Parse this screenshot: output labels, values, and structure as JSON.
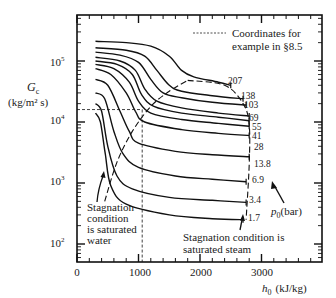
{
  "chart_data": {
    "type": "line",
    "title": "",
    "xlabel": "h0 (kJ/kg)",
    "ylabel": "Gc (kg/m² s)",
    "xscale": "linear",
    "yscale": "log",
    "xlim": [
      0,
      3900
    ],
    "ylim": [
      50,
      450000
    ],
    "x_ticks": [
      "0",
      "1000",
      "2000",
      "3000"
    ],
    "y_ticks": [
      "10^2",
      "10^3",
      "10^4",
      "10^5"
    ],
    "legend_title": "p0(bar)",
    "series": [
      {
        "name": "207",
        "x": [
          300,
          800,
          1200,
          1500,
          1700,
          1900,
          2300,
          2500
        ],
        "y": [
          210000,
          200000,
          175000,
          120000,
          70000,
          55000,
          45000,
          40000
        ]
      },
      {
        "name": "138",
        "x": [
          300,
          800,
          1100,
          1300,
          1500,
          1700,
          2200,
          2700
        ],
        "y": [
          165000,
          150000,
          120000,
          70000,
          40000,
          32000,
          27000,
          24000
        ]
      },
      {
        "name": "103",
        "x": [
          300,
          700,
          1000,
          1200,
          1400,
          1700,
          2200,
          2750
        ],
        "y": [
          140000,
          125000,
          95000,
          50000,
          30000,
          25000,
          21000,
          19000
        ]
      },
      {
        "name": "69",
        "x": [
          300,
          700,
          950,
          1100,
          1300,
          1700,
          2300,
          2800
        ],
        "y": [
          115000,
          100000,
          70000,
          35000,
          22000,
          17000,
          14000,
          12500
        ]
      },
      {
        "name": "55",
        "x": [
          300,
          650,
          900,
          1050,
          1250,
          1700,
          2300,
          2800
        ],
        "y": [
          100000,
          88000,
          60000,
          28000,
          18000,
          14000,
          12000,
          10500
        ]
      },
      {
        "name": "41",
        "x": [
          300,
          600,
          850,
          1000,
          1200,
          1700,
          2300,
          2800
        ],
        "y": [
          88000,
          75000,
          45000,
          22000,
          14000,
          11000,
          9500,
          8500
        ]
      },
      {
        "name": "28",
        "x": [
          300,
          550,
          800,
          950,
          1100,
          1700,
          2300,
          2800
        ],
        "y": [
          75000,
          60000,
          30000,
          15000,
          10000,
          7500,
          6500,
          6000
        ]
      },
      {
        "name": "13.8",
        "x": [
          300,
          500,
          700,
          850,
          1000,
          1600,
          2200,
          2800
        ],
        "y": [
          50000,
          40000,
          15000,
          7000,
          4500,
          3300,
          2900,
          2700
        ]
      },
      {
        "name": "6.9",
        "x": [
          300,
          450,
          600,
          750,
          1000,
          1600,
          2200,
          2750
        ],
        "y": [
          30000,
          24000,
          7000,
          3000,
          1800,
          1300,
          1150,
          1050
        ]
      },
      {
        "name": "3.4",
        "x": [
          300,
          400,
          500,
          650,
          900,
          1500,
          2200,
          2750
        ],
        "y": [
          20000,
          15000,
          4000,
          1300,
          800,
          580,
          520,
          480
        ]
      },
      {
        "name": "1.7",
        "x": [
          300,
          380,
          460,
          550,
          800,
          1500,
          2200,
          2700
        ],
        "y": [
          14000,
          10000,
          3000,
          900,
          450,
          300,
          260,
          250
        ]
      }
    ],
    "boundary_curves": [
      {
        "name": "saturated water (stagnation)",
        "style": "dashed",
        "x": [
          450,
          650,
          900,
          1200,
          1500,
          1800
        ],
        "y": [
          500,
          2200,
          7000,
          18000,
          32000,
          48000
        ]
      },
      {
        "name": "saturated steam (stagnation)",
        "style": "dashed",
        "x": [
          1800,
          2400,
          2700,
          2800,
          2800,
          2750
        ],
        "y": [
          48000,
          40000,
          20000,
          9000,
          2000,
          250
        ]
      }
    ],
    "example_coordinates": {
      "x": 1060,
      "y": 16000,
      "style": "dashed"
    },
    "annotations": [
      "Coordinates for example in §8.5",
      "Stagnation condition is saturated water",
      "Stagnation condition is saturated steam",
      "p0(bar)"
    ]
  },
  "labels": {
    "ylabel_main": "G",
    "ylabel_sub": "c",
    "ylabel_units": "(kg/m² s)",
    "xlabel_main": "h",
    "xlabel_sub": "0",
    "xlabel_units": "(kJ/kg)",
    "ytick_base": "10",
    "ytick_exps": [
      "5",
      "4",
      "3",
      "2"
    ],
    "xticks": [
      "0",
      "1000",
      "2000",
      "3000"
    ],
    "legend_line1": "Coordinates for",
    "legend_line2": "example in §8.5",
    "water_note": [
      "Stagnation",
      "condition",
      "is saturated",
      "water"
    ],
    "steam_note": [
      "Stagnation condition is",
      "saturated steam"
    ],
    "pressure_main": "p",
    "pressure_sub": "0",
    "pressure_units": "(bar)",
    "pressures": [
      "207",
      "138",
      "103",
      "69",
      "55",
      "41",
      "28",
      "13.8",
      "6.9",
      "3.4",
      "1.7"
    ]
  }
}
